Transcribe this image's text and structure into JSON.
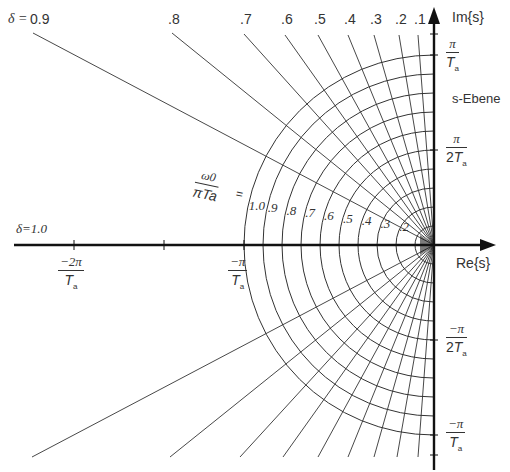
{
  "diagram": {
    "title": "s-Ebene",
    "origin": {
      "x": 434,
      "y": 245
    },
    "scale_pi_over_Ta_px": 190,
    "axes": {
      "im_label": "Im{s}",
      "re_label": "Re{s}",
      "color": "#111111"
    },
    "im_ticks": [
      {
        "num": "π",
        "den": "T",
        "den_sub": "a",
        "y": 55
      },
      {
        "num": "π",
        "den": "2T",
        "den_sub": "a",
        "y": 150
      },
      {
        "num": "−π",
        "den": "2T",
        "den_sub": "a",
        "y": 340
      },
      {
        "num": "−π",
        "den": "T",
        "den_sub": "a",
        "y": 435
      }
    ],
    "re_ticks": [
      {
        "num": "−2π",
        "den": "T",
        "den_sub": "a",
        "x": 74
      },
      {
        "num": "−π",
        "den": "T",
        "den_sub": "a",
        "x": 244
      }
    ],
    "damping_label_prefix": "δ = ",
    "damping_lines": [
      {
        "delta": "0.9",
        "label": "0.9",
        "top": [
          33,
          33
        ],
        "bottom": [
          32,
          457
        ]
      },
      {
        "delta": "0.8",
        "label": ".8",
        "top": [
          172,
          33
        ],
        "bottom": [
          170,
          457
        ]
      },
      {
        "delta": "0.7",
        "label": ".7",
        "top": [
          244,
          34
        ],
        "bottom": [
          240,
          457
        ]
      },
      {
        "delta": "0.6",
        "label": ".6",
        "top": [
          285,
          35
        ],
        "bottom": [
          283,
          457
        ]
      },
      {
        "delta": "0.5",
        "label": ".5",
        "top": [
          318,
          35
        ],
        "bottom": [
          318,
          457
        ]
      },
      {
        "delta": "0.4",
        "label": ".4",
        "top": [
          348,
          35
        ],
        "bottom": [
          348,
          457
        ]
      },
      {
        "delta": "0.3",
        "label": ".3",
        "top": [
          374,
          35
        ],
        "bottom": [
          374,
          457
        ]
      },
      {
        "delta": "0.2",
        "label": ".2",
        "top": [
          399,
          35
        ],
        "bottom": [
          397,
          457
        ]
      },
      {
        "delta": "0.1",
        "label": ".1",
        "top": [
          418,
          35
        ],
        "bottom": [
          418,
          457
        ]
      }
    ],
    "damping_one_label": "δ=1.0",
    "omega_label": {
      "num": "ω0",
      "den": "πTa",
      "eq": "="
    },
    "omega_arcs": [
      {
        "k": 1.0,
        "label": "1.0"
      },
      {
        "k": 0.9,
        "label": ".9"
      },
      {
        "k": 0.8,
        "label": ".8"
      },
      {
        "k": 0.7,
        "label": ".7"
      },
      {
        "k": 0.6,
        "label": ".6"
      },
      {
        "k": 0.5,
        "label": ".5"
      },
      {
        "k": 0.4,
        "label": ".4"
      },
      {
        "k": 0.3,
        "label": ".3"
      },
      {
        "k": 0.2,
        "label": ".2"
      },
      {
        "k": 0.1,
        "label": ""
      }
    ],
    "colors": {
      "grid": "#333333",
      "text": "#333333",
      "background": "#ffffff"
    }
  }
}
